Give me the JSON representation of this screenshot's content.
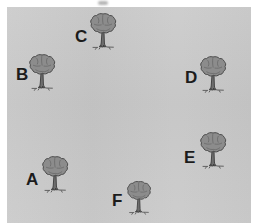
{
  "scene": {
    "title": "Tree layout diagram",
    "background_color": "#ffffff",
    "canvas_color": "#c9c9c9",
    "canvas": {
      "x": 7,
      "y": 7,
      "width": 244,
      "height": 216
    },
    "label_color": "#1c1c1c",
    "canopy_color": "#8c8c8c",
    "canopy_outline_color": "#4a4a4a",
    "trunk_color": "#6e6e6e",
    "trunk_outline_color": "#3a3a3a"
  },
  "artifacts": [
    {
      "name": "top-smudge",
      "x": 98,
      "y": 1,
      "width": 10,
      "height": 4
    }
  ],
  "trees": [
    {
      "id": "A",
      "label": "A",
      "label_x": 26,
      "label_y": 171,
      "tree_x": 40,
      "tree_y": 155,
      "scale": 1.0
    },
    {
      "id": "B",
      "label": "B",
      "label_x": 16,
      "label_y": 66,
      "tree_x": 27,
      "tree_y": 53,
      "scale": 1.0
    },
    {
      "id": "C",
      "label": "C",
      "label_x": 75,
      "label_y": 28,
      "tree_x": 88,
      "tree_y": 12,
      "scale": 1.0
    },
    {
      "id": "D",
      "label": "D",
      "label_x": 185,
      "label_y": 69,
      "tree_x": 198,
      "tree_y": 55,
      "scale": 1.0
    },
    {
      "id": "E",
      "label": "E",
      "label_x": 184,
      "label_y": 149,
      "tree_x": 198,
      "tree_y": 131,
      "scale": 1.0
    },
    {
      "id": "F",
      "label": "F",
      "label_x": 112,
      "label_y": 192,
      "tree_x": 125,
      "tree_y": 180,
      "scale": 0.92
    }
  ]
}
